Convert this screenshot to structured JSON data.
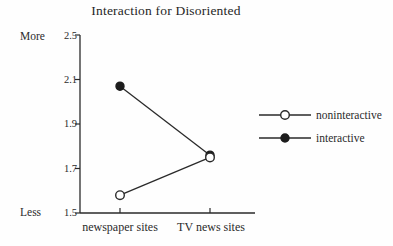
{
  "chart_data": {
    "type": "line",
    "title": "Interaction for Disoriented",
    "categories": [
      "newspaper sites",
      "TV news sites"
    ],
    "series": [
      {
        "name": "interactive",
        "marker": "filled-circle",
        "values": [
          2.07,
          1.76
        ]
      },
      {
        "name": "noninteractive",
        "marker": "open-circle",
        "values": [
          1.58,
          1.75
        ]
      }
    ],
    "yticks": [
      "2.5",
      "2.1",
      "1.9",
      "1.7",
      "1.5"
    ],
    "y_axis_top_label": "More",
    "y_axis_bottom_label": "Less",
    "ylim": [
      1.5,
      2.5
    ],
    "xlabel": "",
    "ylabel": "",
    "grid": false,
    "legend_position": "right",
    "legend_order": [
      "noninteractive",
      "interactive"
    ],
    "colors": {
      "line": "#2a2a2a",
      "marker_fill": "#1c1c1c",
      "marker_open_fill": "#ffffff",
      "background": "#fefefe"
    }
  }
}
